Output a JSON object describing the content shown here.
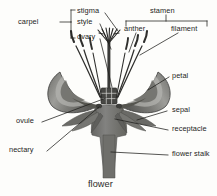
{
  "diagram": {
    "caption": "flower",
    "background_color": "#fdfdfb",
    "ink_color": "#1d1d1b",
    "flower_fill": "#7c7c78",
    "flower_fill_dark": "#5a5a57",
    "flower_fill_light": "#a8a8a4",
    "petal_highlight": "#bdbdb8"
  },
  "groups": {
    "carpel": {
      "label": "carpel",
      "members": [
        "stigma",
        "style",
        "ovary"
      ]
    },
    "stamen": {
      "label": "stamen",
      "members": [
        "anther",
        "filament"
      ]
    }
  },
  "labels": {
    "carpel": "carpel",
    "stigma": "stigma",
    "style": "style",
    "ovary": "ovary",
    "stamen": "stamen",
    "anther": "anther",
    "filament": "filament",
    "petal": "petal",
    "sepal": "sepal",
    "ovule": "ovule",
    "nectary": "nectary",
    "receptacle": "receptacle",
    "flower_stalk": "flower stalk",
    "caption": "flower"
  }
}
